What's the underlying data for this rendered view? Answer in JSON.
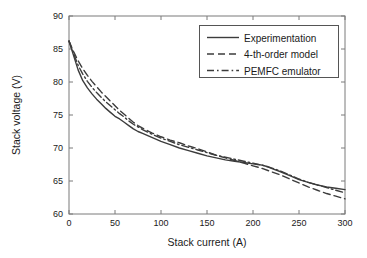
{
  "chart_data": {
    "type": "line",
    "title": "",
    "xlabel": "Stack current (A)",
    "ylabel": "Stack voltage (V)",
    "xlim": [
      0,
      300
    ],
    "ylim": [
      60,
      90
    ],
    "xticks": [
      0,
      50,
      100,
      150,
      200,
      250,
      300
    ],
    "yticks": [
      60,
      65,
      70,
      75,
      80,
      85,
      90
    ],
    "grid": false,
    "legend_position": "upper right",
    "line_color": "#3c3c3c",
    "axis_color": "#7a7a7a",
    "series": [
      {
        "name": "Experimentation",
        "style": "solid",
        "x": [
          0,
          5,
          10,
          15,
          20,
          25,
          30,
          35,
          40,
          45,
          50,
          55,
          60,
          65,
          70,
          75,
          80,
          90,
          100,
          110,
          120,
          130,
          140,
          150,
          160,
          170,
          180,
          190,
          200,
          205,
          210,
          215,
          220,
          230,
          240,
          250,
          260,
          270,
          280,
          290,
          300
        ],
        "y": [
          86.2,
          84.0,
          81.8,
          80.2,
          79.1,
          78.2,
          77.4,
          76.7,
          76.0,
          75.4,
          74.8,
          74.4,
          73.9,
          73.4,
          72.9,
          72.5,
          72.2,
          71.6,
          71.0,
          70.5,
          70.0,
          69.6,
          69.2,
          68.8,
          68.5,
          68.2,
          68.0,
          67.8,
          67.6,
          67.5,
          67.4,
          67.2,
          66.9,
          66.4,
          65.8,
          65.2,
          64.8,
          64.4,
          64.1,
          63.9,
          63.7
        ]
      },
      {
        "name": "4-th-order model",
        "style": "dashed",
        "x": [
          0,
          5,
          10,
          15,
          20,
          25,
          30,
          35,
          40,
          45,
          50,
          55,
          60,
          65,
          70,
          75,
          80,
          90,
          100,
          110,
          120,
          130,
          140,
          150,
          160,
          170,
          180,
          190,
          200,
          210,
          220,
          230,
          240,
          250,
          260,
          270,
          280,
          290,
          300
        ],
        "y": [
          86.2,
          84.6,
          83.2,
          82.0,
          81.0,
          80.1,
          79.3,
          78.5,
          77.8,
          77.1,
          76.4,
          75.7,
          75.1,
          74.5,
          73.9,
          73.4,
          73.0,
          72.3,
          71.7,
          71.2,
          70.8,
          70.3,
          69.9,
          69.4,
          68.9,
          68.5,
          68.1,
          67.7,
          67.3,
          66.9,
          66.4,
          65.9,
          65.3,
          64.7,
          64.1,
          63.6,
          63.1,
          62.7,
          62.3
        ]
      },
      {
        "name": "PEMFC emulator",
        "style": "dashdot",
        "x": [
          0,
          5,
          10,
          15,
          20,
          25,
          30,
          35,
          40,
          45,
          50,
          55,
          60,
          65,
          70,
          75,
          80,
          90,
          100,
          110,
          120,
          130,
          140,
          150,
          160,
          170,
          180,
          190,
          200,
          210,
          220,
          230,
          240,
          250,
          260,
          270,
          280,
          290,
          300
        ],
        "y": [
          86.2,
          84.3,
          82.5,
          81.2,
          80.1,
          79.2,
          78.4,
          77.7,
          77.0,
          76.4,
          75.8,
          75.2,
          74.7,
          74.1,
          73.6,
          73.2,
          72.8,
          72.1,
          71.5,
          71.0,
          70.5,
          70.1,
          69.7,
          69.3,
          68.9,
          68.6,
          68.3,
          68.0,
          67.7,
          67.4,
          67.0,
          66.5,
          65.9,
          65.3,
          64.8,
          64.4,
          64.0,
          63.6,
          63.2
        ]
      }
    ]
  },
  "legend": {
    "items": [
      {
        "label": "Experimentation"
      },
      {
        "label": "4-th-order model"
      },
      {
        "label": "PEMFC emulator"
      }
    ]
  }
}
